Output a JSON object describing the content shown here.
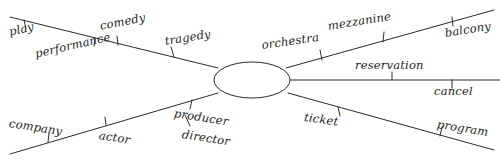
{
  "diagram": {
    "style": "hand-drawn semantic network with central node and five radiating labeled spokes",
    "background_color": "#ffffff",
    "stroke_color": "#2b2b2b",
    "text_color": "#1d1d1d",
    "center_node": {
      "shape": "ellipse",
      "label": "",
      "cx": 252,
      "cy": 80,
      "rx": 38,
      "ry": 18
    },
    "spokes": [
      {
        "name": "upper-left-spoke",
        "direction": "upper-left",
        "labels": [
          "play",
          "performance",
          "comedy",
          "tragedy"
        ]
      },
      {
        "name": "upper-right-spoke",
        "direction": "upper-right",
        "labels": [
          "orchestra",
          "mezzanine",
          "balcony"
        ]
      },
      {
        "name": "right-spoke",
        "direction": "right",
        "labels": [
          "reservation",
          "cancel"
        ]
      },
      {
        "name": "lower-left-spoke",
        "direction": "lower-left",
        "labels": [
          "company",
          "actor",
          "producer",
          "director"
        ]
      },
      {
        "name": "lower-right-spoke",
        "direction": "lower-right",
        "labels": [
          "ticket",
          "program"
        ]
      }
    ],
    "labels": [
      {
        "key": "play",
        "text": "play",
        "x": 8,
        "y": 27,
        "rotate": -13
      },
      {
        "key": "performance",
        "text": "performance",
        "x": 34,
        "y": 49,
        "rotate": -13
      },
      {
        "key": "comedy",
        "text": "comedy",
        "x": 99,
        "y": 21,
        "rotate": -11
      },
      {
        "key": "tragedy",
        "text": "tragedy",
        "x": 164,
        "y": 36,
        "rotate": -9
      },
      {
        "key": "orchestra",
        "text": "orchestra",
        "x": 261,
        "y": 40,
        "rotate": -8
      },
      {
        "key": "mezzanine",
        "text": "mezzanine",
        "x": 327,
        "y": 21,
        "rotate": -9
      },
      {
        "key": "balcony",
        "text": "balcony",
        "x": 444,
        "y": 28,
        "rotate": -9
      },
      {
        "key": "reservation",
        "text": "reservation",
        "x": 355,
        "y": 60,
        "rotate": 0
      },
      {
        "key": "cancel",
        "text": "cancel",
        "x": 434,
        "y": 86,
        "rotate": 0
      },
      {
        "key": "company",
        "text": "company",
        "x": 10,
        "y": 118,
        "rotate": 9
      },
      {
        "key": "actor",
        "text": "actor",
        "x": 100,
        "y": 130,
        "rotate": 9
      },
      {
        "key": "producer",
        "text": "producer",
        "x": 175,
        "y": 108,
        "rotate": 9
      },
      {
        "key": "director",
        "text": "director",
        "x": 183,
        "y": 129,
        "rotate": 9
      },
      {
        "key": "ticket",
        "text": "ticket",
        "x": 305,
        "y": 112,
        "rotate": 8
      },
      {
        "key": "program",
        "text": "program",
        "x": 438,
        "y": 119,
        "rotate": 9
      }
    ]
  }
}
